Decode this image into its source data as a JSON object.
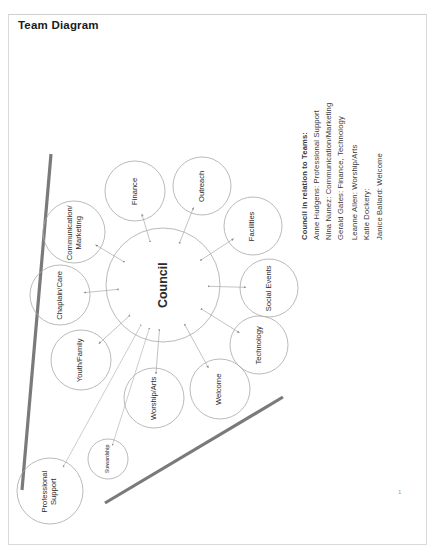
{
  "document": {
    "title": "Team Diagram",
    "page_number": "1"
  },
  "legend": {
    "heading": "Council in relation to Teams:",
    "entries": [
      "Anne Hudgens: Professional Support",
      "Nina Nunez: Communication/Marketing",
      "Gerald Gates: Finance, Technology",
      "Leanne Allen: Worship/Arts",
      "Katie Dockery:",
      "Janice Ballard: Welcome"
    ]
  },
  "diagram": {
    "hub": {
      "label": "Council",
      "cx": 163,
      "cy": 285,
      "r": 57,
      "font_size": 12.5
    },
    "nodes": [
      {
        "label": "Finance",
        "cx": 135,
        "cy": 191,
        "r": 30,
        "font_size": 7.6,
        "lines": 1
      },
      {
        "label": "Outreach",
        "cx": 202,
        "cy": 186,
        "r": 29,
        "font_size": 7.6,
        "lines": 1
      },
      {
        "label": "Facilities",
        "cx": 253,
        "cy": 226,
        "r": 29,
        "font_size": 7.6,
        "lines": 1
      },
      {
        "label": "Social Events",
        "cx": 269,
        "cy": 288,
        "r": 29,
        "font_size": 7.6,
        "lines": 1
      },
      {
        "label": "Technology",
        "cx": 259,
        "cy": 345,
        "r": 29,
        "font_size": 7.6,
        "lines": 1
      },
      {
        "label": "Welcome",
        "cx": 220,
        "cy": 389,
        "r": 30,
        "font_size": 7.6,
        "lines": 1
      },
      {
        "label": "Worship/Arts",
        "cx": 154,
        "cy": 398,
        "r": 30,
        "font_size": 7.6,
        "lines": 1
      },
      {
        "label": "Youth/Family",
        "cx": 81,
        "cy": 360,
        "r": 30,
        "font_size": 7.6,
        "lines": 1
      },
      {
        "label": "Chaplain/Care",
        "cx": 60,
        "cy": 295,
        "r": 30,
        "font_size": 7.6,
        "lines": 1
      },
      {
        "label": "Communication/ Marketing",
        "cx": 74,
        "cy": 232,
        "r": 31,
        "font_size": 7.6,
        "lines": 2
      },
      {
        "label": "Stewardship",
        "cx": 108,
        "cy": 459,
        "r": 20,
        "font_size": 5.2,
        "lines": 1
      },
      {
        "label": "Professional Support",
        "cx": 50,
        "cy": 491,
        "r": 33,
        "font_size": 7.6,
        "lines": 2
      }
    ],
    "colors": {
      "circle_stroke": "#a8a8a8",
      "connector": "#9a9a9a",
      "accent_bar": "#7a7a7a",
      "text": "#2b2b2b"
    },
    "accent_bars": [
      {
        "name": "left-diagonal-bar",
        "x1": 51,
        "y1": 154,
        "x2": 22,
        "y2": 490
      },
      {
        "name": "right-diagonal-bar",
        "x1": 283,
        "y1": 397,
        "x2": 105,
        "y2": 503
      }
    ]
  }
}
